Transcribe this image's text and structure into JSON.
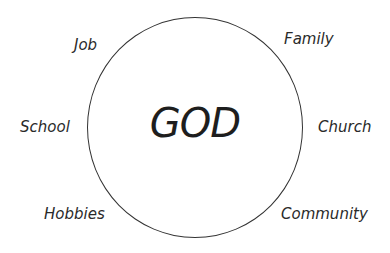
{
  "diagram": {
    "center_label": "GOD",
    "surrounding_labels": {
      "job": "Job",
      "family": "Family",
      "school": "School",
      "church": "Church",
      "hobbies": "Hobbies",
      "community": "Community"
    }
  }
}
